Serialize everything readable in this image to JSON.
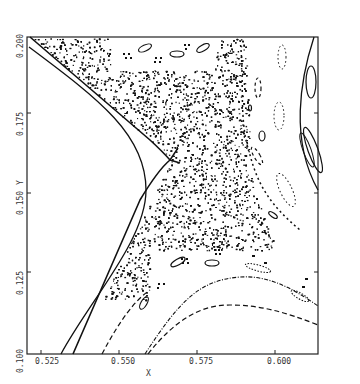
{
  "chart_data": {
    "type": "scatter",
    "title": "",
    "xlabel": "X",
    "ylabel": "Y",
    "xlim": [
      0.5205,
      0.6135
    ],
    "ylim": [
      0.099,
      0.2
    ],
    "grid": false,
    "legend": null,
    "x_ticks": [
      "0.525",
      "0.550",
      "0.575",
      "0.600"
    ],
    "y_ticks": [
      "0.100",
      "0.125",
      "0.150",
      "0.175",
      "0.200"
    ],
    "features": {
      "hyperbolic_point": [
        0.57,
        0.161
      ],
      "separatrix_left_branch_top": [
        0.5215,
        0.1985
      ],
      "separatrix_left_branch_bottom": [
        0.5345,
        0.1
      ],
      "inner_curve_vertex": [
        0.565,
        0.152
      ],
      "chaotic_region": "dense dots between separatrices",
      "island_chains": [
        "upper-left small islands",
        "right dashed/dotted islands",
        "lower islands"
      ],
      "lower_invariant_curves": 2
    }
  },
  "axes": {
    "x_label": "X",
    "y_label": "Y",
    "x_tick_labels": [
      "0.525",
      "0.550",
      "0.575",
      "0.600"
    ],
    "y_tick_labels": [
      "0.100",
      "0.125",
      "0.150",
      "0.175",
      "0.200"
    ]
  }
}
